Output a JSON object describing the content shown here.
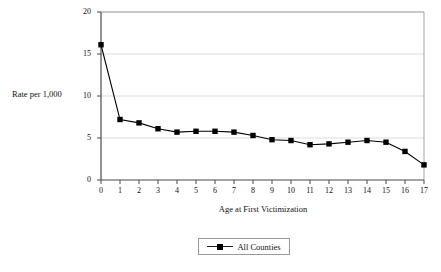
{
  "chart_data": {
    "type": "line",
    "title": "",
    "xlabel": "Age at First Victimization",
    "ylabel": "Rate per 1,000",
    "x": [
      0,
      1,
      2,
      3,
      4,
      5,
      6,
      7,
      8,
      9,
      10,
      11,
      12,
      13,
      14,
      15,
      16,
      17
    ],
    "categories": [
      "0",
      "1",
      "2",
      "3",
      "4",
      "5",
      "6",
      "7",
      "8",
      "9",
      "10",
      "11",
      "12",
      "13",
      "14",
      "15",
      "16",
      "17"
    ],
    "series": [
      {
        "name": "All Counties",
        "marker": "square",
        "color": "#000000",
        "values": [
          16.1,
          7.2,
          6.8,
          6.1,
          5.7,
          5.8,
          5.8,
          5.7,
          5.3,
          4.8,
          4.7,
          4.2,
          4.3,
          4.5,
          4.7,
          4.5,
          3.4,
          1.8
        ]
      }
    ],
    "ylim": [
      0,
      20
    ],
    "ytick_labels": [
      "0",
      "5",
      "10",
      "15",
      "20"
    ],
    "yticks": [
      0,
      5,
      10,
      15,
      20
    ],
    "xlim": [
      0,
      17
    ],
    "grid": "horizontal",
    "grid_color": "#d4d4d4",
    "legend_position": "bottom-center",
    "legend_entries": [
      "All Counties"
    ],
    "axis_color": "#4a4a4a",
    "background": "#ffffff"
  }
}
